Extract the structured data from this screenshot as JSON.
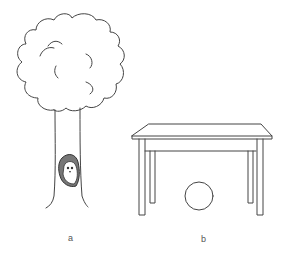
{
  "figure": {
    "panels": [
      {
        "label": "a",
        "description": "tree with an animal in a hollow of the trunk"
      },
      {
        "label": "b",
        "description": "table with a ball underneath"
      }
    ]
  },
  "colors": {
    "stroke": "#444444",
    "background": "#ffffff"
  }
}
